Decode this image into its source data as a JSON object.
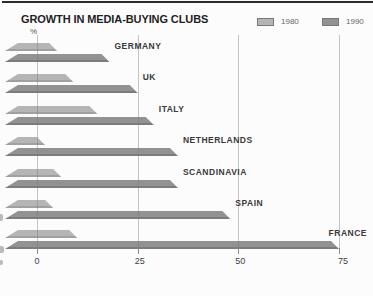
{
  "chart_data": {
    "type": "bar",
    "orientation": "horizontal",
    "title": "GROWTH IN MEDIA-BUYING CLUBS",
    "unit_label": "%",
    "categories": [
      "GERMANY",
      "UK",
      "ITALY",
      "NETHERLANDS",
      "SCANDINAVIA",
      "SPAIN",
      "FRANCE"
    ],
    "series": [
      {
        "name": "1980",
        "color": "#b5b5b5",
        "edge_color": "#a0a0a0",
        "values": [
          5,
          9,
          15,
          2,
          6,
          4,
          10
        ]
      },
      {
        "name": "1990",
        "color": "#929292",
        "edge_color": "#7c7c7c",
        "values": [
          18,
          25,
          29,
          35,
          35,
          48,
          75
        ]
      }
    ],
    "x_ticks": [
      0,
      25,
      50,
      75
    ],
    "x_tick_labels": [
      "0",
      "25",
      "50",
      "75"
    ],
    "xlim": [
      0,
      75
    ],
    "grid": "vertical-gridlines",
    "legend_position": "top-right",
    "style": "3d-flat-ribbon-bars, scanned print chart"
  },
  "legend": {
    "items": [
      {
        "label": "1980",
        "color": "#b5b5b5"
      },
      {
        "label": "1990",
        "color": "#929292"
      }
    ]
  }
}
